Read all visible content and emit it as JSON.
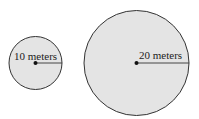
{
  "diagram": {
    "fill_color": "#e4e4e4",
    "stroke_color": "#333333",
    "circles": [
      {
        "name": "small",
        "label": "10 meters",
        "radius_value": 10
      },
      {
        "name": "large",
        "label": "20 meters",
        "radius_value": 20
      }
    ]
  }
}
